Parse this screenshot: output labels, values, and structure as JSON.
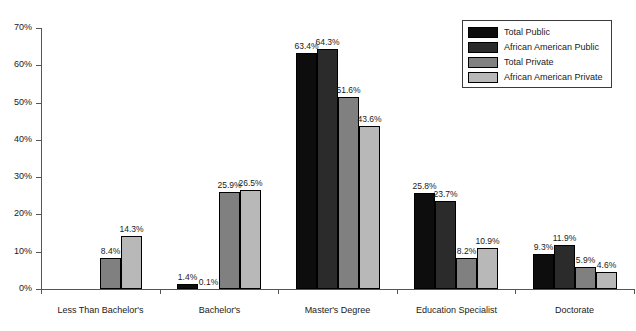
{
  "chart_data": {
    "type": "bar",
    "title": "",
    "subtitle": "",
    "xlabel": "",
    "ylabel": "",
    "ylim": [
      0,
      70
    ],
    "ytick_labels": [
      "0%",
      "10%",
      "20%",
      "30%",
      "40%",
      "50%",
      "60%",
      "70%"
    ],
    "ytick_values": [
      0,
      10,
      20,
      30,
      40,
      50,
      60,
      70
    ],
    "grid": false,
    "legend_position": "top-right",
    "value_label_suffix": "%",
    "categories": [
      "Less Than Bachelor's",
      "Bachelor's",
      "Master's Degree",
      "Education Specialist",
      "Doctorate"
    ],
    "series": [
      {
        "name": "Total Public",
        "color": "#0d0d0d",
        "values": [
          0.0,
          1.4,
          63.4,
          25.8,
          9.3
        ],
        "labels": [
          "",
          "1.4%",
          "63.4%",
          "25.8%",
          "9.3%"
        ]
      },
      {
        "name": "African American Public",
        "color": "#2b2b2b",
        "values": [
          0.0,
          0.1,
          64.3,
          23.7,
          11.9
        ],
        "labels": [
          "",
          "0.1%",
          "64.3%",
          "23.7%",
          "11.9%"
        ]
      },
      {
        "name": "Total Private",
        "color": "#808080",
        "values": [
          8.4,
          25.9,
          51.6,
          8.2,
          5.9
        ],
        "labels": [
          "8.4%",
          "25.9%",
          "51.6%",
          "8.2%",
          "5.9%"
        ]
      },
      {
        "name": "African American Private",
        "color": "#b8b8b8",
        "values": [
          14.3,
          26.5,
          43.6,
          10.9,
          4.6
        ],
        "labels": [
          "14.3%",
          "26.5%",
          "43.6%",
          "10.9%",
          "4.6%"
        ]
      }
    ]
  },
  "legend": {
    "items": [
      {
        "label": "Total Public",
        "color": "#0d0d0d"
      },
      {
        "label": "African American Public",
        "color": "#2b2b2b"
      },
      {
        "label": "Total Private",
        "color": "#808080"
      },
      {
        "label": "African American Private",
        "color": "#b8b8b8"
      }
    ]
  }
}
